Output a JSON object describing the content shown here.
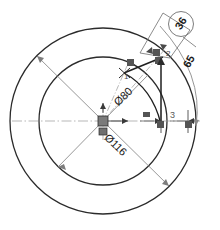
{
  "drawing": {
    "type": "cad-sketch",
    "title": "Concentric circle sketch with dimensions",
    "background_color": "#ffffff",
    "line_color": "#2b2b2b",
    "construction_color": "#8a8a8a",
    "dimension_color": "#1b1b1b"
  },
  "geometry": {
    "center": {
      "x": 103,
      "y": 121,
      "marker": "origin-marker"
    },
    "circles": [
      {
        "name": "outer-circle",
        "cx": 103,
        "cy": 121,
        "r": 93,
        "label": "Ø116"
      },
      {
        "name": "inner-circle",
        "cx": 103,
        "cy": 121,
        "r": 64,
        "label": "Ø80"
      }
    ]
  },
  "dimensions": {
    "diameter_outer": {
      "text": "Ø116",
      "value": 116,
      "symbol": "Ø"
    },
    "diameter_inner": {
      "text": "Ø80",
      "value": 80,
      "symbol": "Ø"
    },
    "angle_callout": {
      "text": "36",
      "value": 36,
      "circled": true
    },
    "arc_dimension": {
      "text": "65",
      "value": 65
    },
    "linear_dimension": {
      "text": "3",
      "value": 3
    }
  },
  "points": [
    {
      "id": "point-1",
      "label": "1",
      "x": 124,
      "y": 72
    },
    {
      "id": "point-2",
      "label": "2",
      "x": 163,
      "y": 57
    },
    {
      "id": "point-3",
      "label": "3",
      "x": 172,
      "y": 117
    }
  ],
  "constraints": [
    {
      "name": "coincident-marker-a",
      "x": 131,
      "y": 63
    },
    {
      "name": "coincident-marker-b",
      "x": 156,
      "y": 52
    },
    {
      "name": "coincident-marker-c",
      "x": 158,
      "y": 60
    },
    {
      "name": "horizontal-marker",
      "x": 146,
      "y": 115
    },
    {
      "name": "point-marker-d",
      "x": 160,
      "y": 124
    },
    {
      "name": "point-marker-e",
      "x": 188,
      "y": 124
    }
  ]
}
